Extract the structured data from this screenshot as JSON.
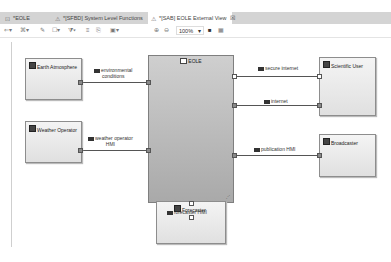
{
  "tabs": [
    {
      "label": "*EOLE",
      "icon": "project-icon",
      "active": false
    },
    {
      "label": "*[SFBD] System Level Functions",
      "icon": "diagram-warning-icon",
      "active": false
    },
    {
      "label": "*[SAB] EOLE External View",
      "icon": "diagram-warning-icon",
      "active": true,
      "close": "☒"
    }
  ],
  "toolbar": {
    "zoom_level": "100%",
    "buttons": [
      "select-tool",
      "arrange-tool",
      "pin-tool",
      "layer-tool",
      "filter-tool",
      "text-tool",
      "note-tool",
      "export-tool",
      "zoom-in",
      "zoom-out",
      "camera-tool",
      "grid-tool"
    ]
  },
  "diagram": {
    "system": {
      "label": "EOLE"
    },
    "actors": [
      {
        "id": "earth-atmosphere",
        "label": "Earth Atmosphere"
      },
      {
        "id": "weather-operator",
        "label": "Weather Operator"
      },
      {
        "id": "scientific-user",
        "label": "Scientific User"
      },
      {
        "id": "broadcaster",
        "label": "Broadcaster"
      },
      {
        "id": "forecaster",
        "label": "Forecaster"
      }
    ],
    "exchanges": [
      {
        "label_1": "environmental",
        "label_2": "conditions"
      },
      {
        "label_1": "weather operator",
        "label_2": "HMI"
      },
      {
        "label_1": "secure internet"
      },
      {
        "label_1": "internet"
      },
      {
        "label_1": "publication HMI"
      },
      {
        "label_1": "forecaster HMI"
      }
    ]
  }
}
